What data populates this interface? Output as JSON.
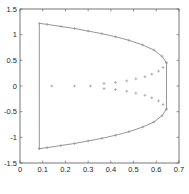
{
  "chart_data": {
    "type": "line",
    "title": "",
    "xlabel": "",
    "ylabel": "",
    "xlim": [
      0,
      0.7
    ],
    "ylim": [
      -1.5,
      1.5
    ],
    "grid": false,
    "legend": null,
    "xticks": [
      "0",
      "0.1",
      "0.2",
      "0.3",
      "0.4",
      "0.5",
      "0.6",
      "0.7"
    ],
    "yticks": [
      "1.5",
      "1",
      "0.5",
      "0",
      "-0.5",
      "-1",
      "-1.5"
    ],
    "series": [
      {
        "name": "outer-boundary",
        "style": "solid line with plus markers",
        "x": [
          0.085,
          0.085,
          0.12,
          0.18,
          0.24,
          0.3,
          0.36,
          0.42,
          0.48,
          0.54,
          0.59,
          0.625,
          0.645,
          0.645,
          0.625,
          0.59,
          0.54,
          0.48,
          0.42,
          0.36,
          0.3,
          0.24,
          0.18,
          0.12,
          0.085
        ],
        "y": [
          -1.22,
          1.22,
          1.2,
          1.16,
          1.12,
          1.07,
          1.02,
          0.96,
          0.89,
          0.8,
          0.7,
          0.58,
          0.45,
          -0.45,
          -0.58,
          -0.7,
          -0.8,
          -0.89,
          -0.96,
          -1.02,
          -1.07,
          -1.12,
          -1.16,
          -1.2,
          -1.22
        ]
      },
      {
        "name": "inner-branch-upper",
        "style": "plus markers",
        "x": [
          0.37,
          0.42,
          0.47,
          0.51,
          0.55,
          0.58,
          0.61,
          0.63,
          0.645
        ],
        "y": [
          0.05,
          0.07,
          0.1,
          0.14,
          0.18,
          0.23,
          0.29,
          0.36,
          0.45
        ]
      },
      {
        "name": "inner-branch-lower",
        "style": "plus markers",
        "x": [
          0.37,
          0.42,
          0.47,
          0.51,
          0.55,
          0.58,
          0.61,
          0.63,
          0.645
        ],
        "y": [
          -0.05,
          -0.07,
          -0.1,
          -0.14,
          -0.18,
          -0.23,
          -0.29,
          -0.36,
          -0.45
        ]
      },
      {
        "name": "axis-points",
        "style": "markers",
        "x": [
          0.14,
          0.24,
          0.31
        ],
        "y": [
          0,
          0,
          0
        ]
      }
    ]
  },
  "colors": {
    "line": "#8a8a8a",
    "axis": "#262626",
    "marker": "#9a9a9a"
  }
}
